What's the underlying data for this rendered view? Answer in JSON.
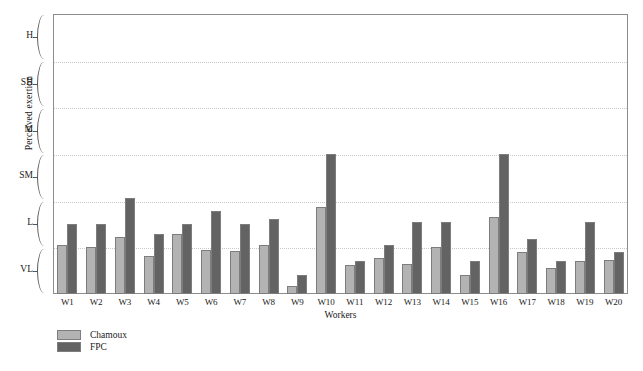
{
  "chart_data": {
    "type": "bar",
    "title": "",
    "xlabel": "Workers",
    "ylabel": "Perceived exertion",
    "grid": true,
    "legend_position": "bottom-left",
    "ylim": [
      0,
      6
    ],
    "ytick_labels": [
      "VL",
      "L",
      "SM",
      "M",
      "SH",
      "H"
    ],
    "ytick_values": [
      0.5,
      1.5,
      2.5,
      3.5,
      4.5,
      5.5
    ],
    "gridline_values": [
      1,
      2,
      3,
      4,
      5
    ],
    "categories": [
      "W1",
      "W2",
      "W3",
      "W4",
      "W5",
      "W6",
      "W7",
      "W8",
      "W9",
      "W10",
      "W11",
      "W12",
      "W13",
      "W14",
      "W15",
      "W16",
      "W17",
      "W18",
      "W19",
      "W20"
    ],
    "series": [
      {
        "name": "Chamoux",
        "color": "#b3b3b3",
        "values": [
          1.05,
          1.0,
          1.22,
          0.82,
          1.28,
          0.95,
          0.92,
          1.05,
          0.18,
          1.87,
          0.62,
          0.78,
          0.64,
          1.0,
          0.4,
          1.65,
          0.9,
          0.55,
          0.7,
          0.72
        ]
      },
      {
        "name": "FPC",
        "color": "#636363",
        "values": [
          1.5,
          1.5,
          2.06,
          1.28,
          1.5,
          1.78,
          1.5,
          1.6,
          0.4,
          3.0,
          0.7,
          1.05,
          1.55,
          1.55,
          0.7,
          3.0,
          1.18,
          0.7,
          1.55,
          0.9
        ]
      }
    ]
  },
  "axis": {
    "y_title": "Perceived exertion",
    "x_title": "Workers"
  },
  "legend": {
    "items": [
      {
        "label": "Chamoux",
        "color": "#b3b3b3"
      },
      {
        "label": "FPC",
        "color": "#636363"
      }
    ]
  }
}
